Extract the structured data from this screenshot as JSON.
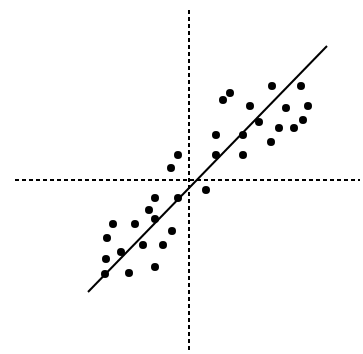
{
  "chart_data": {
    "type": "scatter",
    "title": "",
    "xlabel": "",
    "ylabel": "",
    "grid": false,
    "legend": null,
    "axes": {
      "style": "dashed",
      "color": "#000000",
      "x_axis_pixel": {
        "y": 180,
        "x_start": 15,
        "x_end": 360
      },
      "y_axis_pixel": {
        "x": 189,
        "y_start": 10,
        "y_end": 350
      }
    },
    "xlim": [
      -1,
      1
    ],
    "ylim": [
      -1,
      1
    ],
    "trend_line": {
      "description": "positive linear regression line",
      "color": "#000000",
      "pixel_start": [
        88,
        292
      ],
      "pixel_end": [
        327,
        46
      ]
    },
    "point_color": "#000000",
    "point_radius_px": 4,
    "points_pixel": [
      [
        113,
        224
      ],
      [
        135,
        224
      ],
      [
        107,
        238
      ],
      [
        149,
        210
      ],
      [
        155,
        198
      ],
      [
        155,
        219
      ],
      [
        121,
        252
      ],
      [
        143,
        245
      ],
      [
        163,
        245
      ],
      [
        172,
        231
      ],
      [
        106,
        259
      ],
      [
        105,
        274
      ],
      [
        129,
        273
      ],
      [
        155,
        267
      ],
      [
        178,
        198
      ],
      [
        171,
        168
      ],
      [
        178,
        155
      ],
      [
        206,
        190
      ],
      [
        216,
        155
      ],
      [
        216,
        135
      ],
      [
        223,
        100
      ],
      [
        230,
        93
      ],
      [
        243,
        135
      ],
      [
        243,
        155
      ],
      [
        250,
        106
      ],
      [
        259,
        122
      ],
      [
        272,
        86
      ],
      [
        271,
        142
      ],
      [
        279,
        128
      ],
      [
        286,
        108
      ],
      [
        294,
        128
      ],
      [
        301,
        86
      ],
      [
        303,
        120
      ],
      [
        308,
        106
      ]
    ]
  }
}
